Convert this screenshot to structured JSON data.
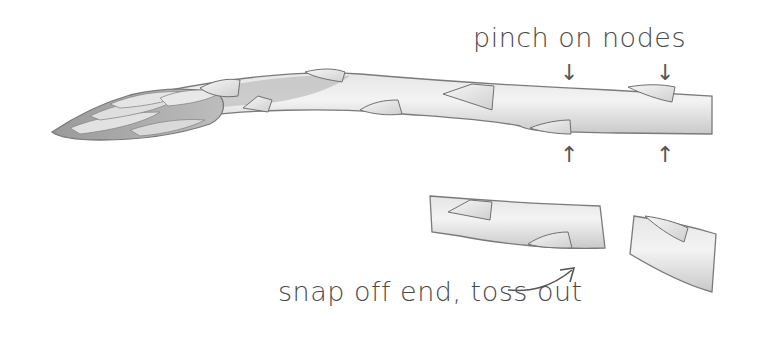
{
  "illustration": {
    "subject": "asparagus spear",
    "labels": {
      "pinch": "pinch on nodes",
      "snap": "snap off end, toss out"
    },
    "arrows": {
      "down": "↓",
      "up": "↑"
    },
    "colors": {
      "background": "#ffffff",
      "stalk_fill": "#dcdcdc",
      "stalk_light": "#efefef",
      "outline": "#6e6e6e",
      "text": "#4a4a4a"
    }
  }
}
